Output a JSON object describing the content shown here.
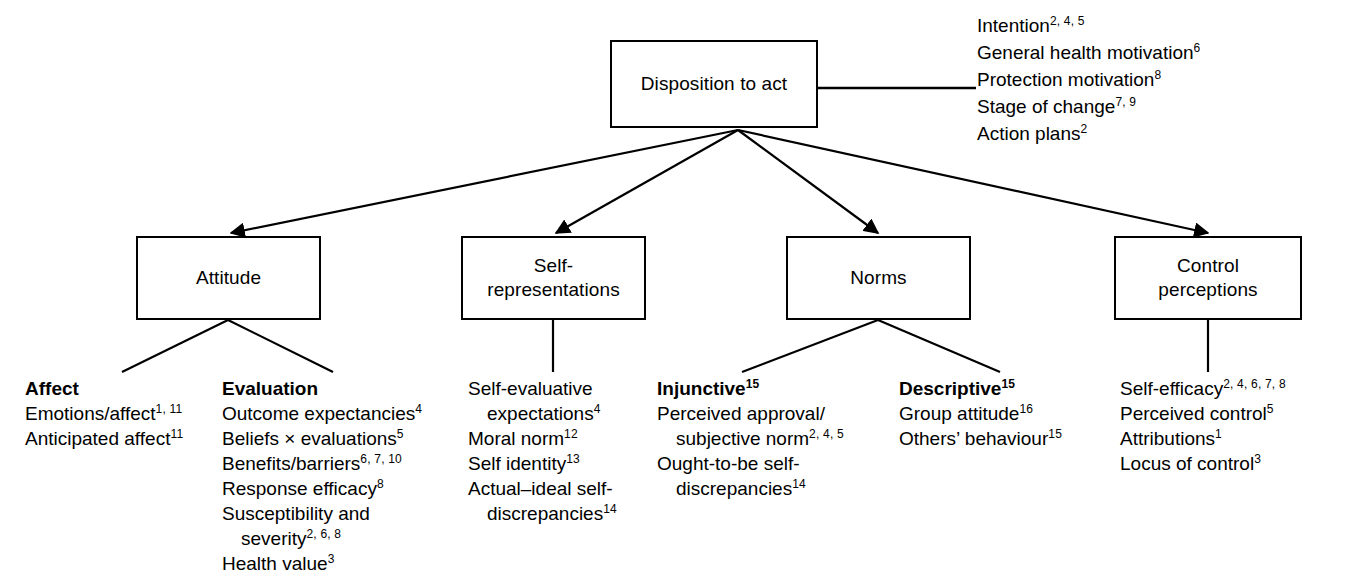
{
  "diagram": {
    "colors": {
      "stroke": "#000000",
      "background": "#ffffff",
      "text": "#000000"
    },
    "root_box": {
      "label": "Disposition to act"
    },
    "right_annotations": [
      {
        "text": "Intention",
        "sup": "2, 4, 5"
      },
      {
        "text": "General health motivation",
        "sup": "6"
      },
      {
        "text": "Protection motivation",
        "sup": "8"
      },
      {
        "text": "Stage of change",
        "sup": "7, 9"
      },
      {
        "text": "Action plans",
        "sup": "2"
      }
    ],
    "boxes": [
      {
        "label": "Attitude"
      },
      {
        "label": "Self-\nrepresentations"
      },
      {
        "label": "Norms"
      },
      {
        "label": "Control\nperceptions"
      }
    ],
    "columns": [
      {
        "heading": "Affect",
        "heading_sup": "",
        "items": [
          {
            "text": "Emotions/affect",
            "sup": "1, 11",
            "indent": false
          },
          {
            "text": "Anticipated affect",
            "sup": "11",
            "indent": false
          }
        ]
      },
      {
        "heading": "Evaluation",
        "heading_sup": "",
        "items": [
          {
            "text": "Outcome expectancies",
            "sup": "4",
            "indent": false
          },
          {
            "text": "Beliefs × evaluations",
            "sup": "5",
            "indent": false
          },
          {
            "text": "Benefits/barriers",
            "sup": "6, 7, 10",
            "indent": false
          },
          {
            "text": "Response efficacy",
            "sup": "8",
            "indent": false
          },
          {
            "text": "Susceptibility and",
            "sup": "",
            "indent": false
          },
          {
            "text": "severity",
            "sup": "2, 6, 8",
            "indent": true
          },
          {
            "text": "Health value",
            "sup": "3",
            "indent": false
          }
        ]
      },
      {
        "heading": "",
        "heading_sup": "",
        "items": [
          {
            "text": "Self-evaluative",
            "sup": "",
            "indent": false
          },
          {
            "text": "expectations",
            "sup": "4",
            "indent": true
          },
          {
            "text": "Moral norm",
            "sup": "12",
            "indent": false
          },
          {
            "text": "Self identity",
            "sup": "13",
            "indent": false
          },
          {
            "text": "Actual–ideal self-",
            "sup": "",
            "indent": false
          },
          {
            "text": "discrepancies",
            "sup": "14",
            "indent": true
          }
        ]
      },
      {
        "heading": "Injunctive",
        "heading_sup": "15",
        "items": [
          {
            "text": "Perceived approval/",
            "sup": "",
            "indent": false
          },
          {
            "text": "subjective norm",
            "sup": "2, 4, 5",
            "indent": true
          },
          {
            "text": "Ought-to-be self-",
            "sup": "",
            "indent": false
          },
          {
            "text": "discrepancies",
            "sup": "14",
            "indent": true
          }
        ]
      },
      {
        "heading": "Descriptive",
        "heading_sup": "15",
        "items": [
          {
            "text": "Group attitude",
            "sup": "16",
            "indent": false
          },
          {
            "text": "Others’ behaviour",
            "sup": "15",
            "indent": false
          }
        ]
      },
      {
        "heading": "",
        "heading_sup": "",
        "items": [
          {
            "text": "Self-efficacy",
            "sup": "2, 4, 6, 7, 8",
            "indent": false
          },
          {
            "text": "Perceived control",
            "sup": "5",
            "indent": false
          },
          {
            "text": "Attributions",
            "sup": "1",
            "indent": false
          },
          {
            "text": "Locus of control",
            "sup": "3",
            "indent": false
          }
        ]
      }
    ]
  }
}
